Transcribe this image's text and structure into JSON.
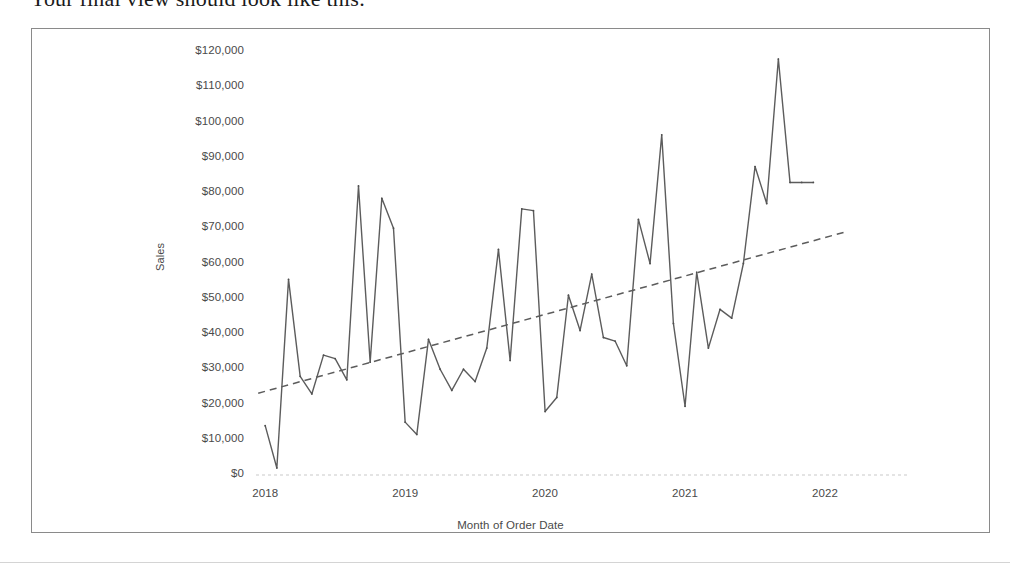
{
  "document": {
    "intro_text": "Your final view should look like this:"
  },
  "chart_data": {
    "type": "line",
    "title": "",
    "xlabel": "Month of Order Date",
    "ylabel": "Sales",
    "ylim": [
      0,
      125000
    ],
    "ytick_labels": [
      "$120,000",
      "$110,000",
      "$100,000",
      "$90,000",
      "$80,000",
      "$70,000",
      "$60,000",
      "$50,000",
      "$40,000",
      "$30,000",
      "$20,000",
      "$10,000",
      "$0"
    ],
    "ytick_values": [
      120000,
      110000,
      100000,
      90000,
      80000,
      70000,
      60000,
      50000,
      40000,
      30000,
      20000,
      10000,
      0
    ],
    "xtick_labels": [
      "2018",
      "2019",
      "2020",
      "2021",
      "2022"
    ],
    "xtick_values": [
      2018,
      2019,
      2020,
      2021,
      2022
    ],
    "xlim": [
      2017.92,
      2022.25
    ],
    "grid": false,
    "legend": "none",
    "series": [
      {
        "name": "Sales",
        "kind": "line",
        "color": "#5c5c5c",
        "x": [
          2018.0,
          2018.0833,
          2018.1667,
          2018.25,
          2018.3333,
          2018.4167,
          2018.5,
          2018.5833,
          2018.6667,
          2018.75,
          2018.8333,
          2018.9167,
          2019.0,
          2019.0833,
          2019.1667,
          2019.25,
          2019.3333,
          2019.4167,
          2019.5,
          2019.5833,
          2019.6667,
          2019.75,
          2019.8333,
          2019.9167,
          2020.0,
          2020.0833,
          2020.1667,
          2020.25,
          2020.3333,
          2020.4167,
          2020.5,
          2020.5833,
          2020.6667,
          2020.75,
          2020.8333,
          2020.9167,
          2021.0,
          2021.0833,
          2021.1667,
          2021.25,
          2021.3333,
          2021.4167,
          2021.5,
          2021.5833,
          2021.6667,
          2021.75,
          2021.8333,
          2021.9167
        ],
        "values": [
          14000,
          2000,
          55500,
          28000,
          23000,
          34000,
          33000,
          27000,
          82000,
          32000,
          78500,
          70000,
          15000,
          11500,
          38500,
          30000,
          24000,
          30000,
          26500,
          36000,
          64000,
          32500,
          75500,
          75000,
          18000,
          22000,
          51000,
          41000,
          57000,
          39000,
          38000,
          31000,
          72500,
          60000,
          96500,
          43000,
          19500,
          57500,
          36000,
          47000,
          44500,
          60000,
          87500,
          77000,
          118000,
          83000,
          83000,
          83000
        ]
      },
      {
        "name": "Trend Line",
        "kind": "trend",
        "style": "dashed",
        "color": "#5c5c5c",
        "x": [
          2017.95,
          2022.15
        ],
        "values": [
          23200,
          69000
        ]
      }
    ],
    "annotations": []
  }
}
